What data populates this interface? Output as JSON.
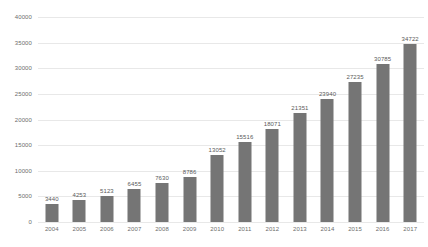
{
  "chart_data": {
    "type": "bar",
    "title": "",
    "subtitle": "",
    "xlabel": "",
    "ylabel": "",
    "categories": [
      "2004",
      "2005",
      "2006",
      "2007",
      "2008",
      "2009",
      "2010",
      "2011",
      "2012",
      "2013",
      "2014",
      "2015",
      "2016",
      "2017"
    ],
    "values": [
      3440,
      4253,
      5123,
      6455,
      7630,
      8786,
      13052,
      15516,
      18071,
      21351,
      23940,
      27235,
      30785,
      34722
    ],
    "data_labels": [
      "3440",
      "4253",
      "5123",
      "6455",
      "7630",
      "8786",
      "13052",
      "15516",
      "18071",
      "21351",
      "23940",
      "27235",
      "30785",
      "34722"
    ],
    "ylim": [
      0,
      40000
    ],
    "ytick_step": 5000,
    "ytick_labels": [
      "40000",
      "35000",
      "30000",
      "25000",
      "20000",
      "15000",
      "10000",
      "5000",
      "0"
    ],
    "ytick_values": [
      40000,
      35000,
      30000,
      25000,
      20000,
      15000,
      10000,
      5000,
      0
    ],
    "grid": true,
    "grid_axis": "y",
    "legend": false,
    "legend_position": "none",
    "colors": {
      "bar": "#757575",
      "grid": "#e8e8e8",
      "tick_text": "#6d6d6d",
      "label_text": "#5a5a5a",
      "background": "#ffffff"
    }
  }
}
